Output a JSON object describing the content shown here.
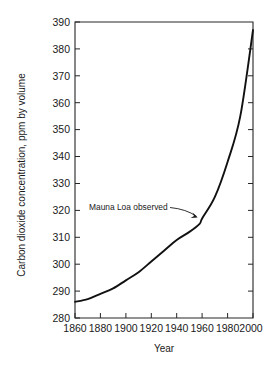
{
  "chart_data": {
    "type": "line",
    "title": "",
    "xlabel": "Year",
    "ylabel": "Carbon dioxide concentration, ppm by volume",
    "xlim": [
      1860,
      2000
    ],
    "ylim": [
      280,
      390
    ],
    "xticks": [
      1860,
      1880,
      1900,
      1920,
      1940,
      1960,
      1980,
      2000
    ],
    "yticks": [
      280,
      290,
      300,
      310,
      320,
      330,
      340,
      350,
      360,
      370,
      380,
      390
    ],
    "xtick_labels": [
      "1860",
      "1880",
      "1900",
      "1920",
      "1940",
      "1960",
      "1980",
      "2000"
    ],
    "ytick_labels": [
      "280",
      "290",
      "300",
      "310",
      "320",
      "330",
      "340",
      "350",
      "360",
      "370",
      "380",
      "390"
    ],
    "grid": false,
    "legend": null,
    "series": [
      {
        "name": "Carbon dioxide concentration",
        "x": [
          1860,
          1870,
          1880,
          1890,
          1900,
          1910,
          1920,
          1930,
          1940,
          1950,
          1958,
          1960,
          1970,
          1980,
          1990,
          2000
        ],
        "values": [
          286,
          287,
          289,
          291,
          294,
          297,
          301,
          305,
          309,
          312,
          315,
          317,
          325,
          338,
          355,
          387
        ]
      }
    ],
    "annotations": [
      {
        "text": "Mauna Loa observed",
        "points_to_x": 1958,
        "points_to_y": 317
      }
    ]
  },
  "axis": {
    "y_title": "Carbon dioxide concentration, ppm by volume",
    "x_title": "Year"
  },
  "annotation": {
    "mauna_loa_label": "Mauna Loa observed"
  },
  "ytick": {
    "t0": "280",
    "t1": "290",
    "t2": "300",
    "t3": "310",
    "t4": "320",
    "t5": "330",
    "t6": "340",
    "t7": "350",
    "t8": "360",
    "t9": "370",
    "t10": "380",
    "t11": "390"
  },
  "xtick": {
    "t0": "1860",
    "t1": "1880",
    "t2": "1900",
    "t3": "1920",
    "t4": "1940",
    "t5": "1960",
    "t6": "1980",
    "t7": "2000"
  },
  "colors": {
    "curve": "#111111",
    "axis": "#262626",
    "text": "#1a1a1a",
    "background": "#ffffff"
  }
}
